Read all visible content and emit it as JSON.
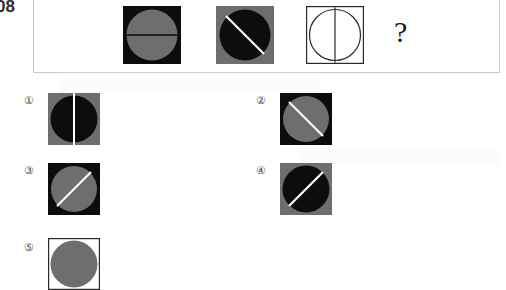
{
  "question": {
    "number_text": "08",
    "unknown_marker": "?"
  },
  "palette": {
    "black": "#0d0d0d",
    "gray": "#6e6e6e",
    "white": "#ffffff",
    "outline": "#2b2b2b",
    "frame_border": "#c9c9c9",
    "page_background": "#ffffff",
    "label_color": "#4a4a4a"
  },
  "stem": {
    "cells": [
      {
        "index": 1,
        "name": "stem-figure-1",
        "background": "#0d0d0d",
        "circle_fill": "#6e6e6e",
        "circle_outline": "none",
        "line_color": "#0d0d0d",
        "line_orientation": "horizontal",
        "description": "black square, gray circle, horizontal black line"
      },
      {
        "index": 2,
        "name": "stem-figure-2",
        "background": "#6e6e6e",
        "circle_fill": "#0d0d0d",
        "circle_outline": "none",
        "line_color": "#ffffff",
        "line_orientation": "diagonal-tl-br",
        "description": "gray square, black circle, white diagonal line from top-left to bottom-right"
      },
      {
        "index": 3,
        "name": "stem-figure-3",
        "background": "#ffffff",
        "circle_fill": "#ffffff",
        "circle_outline": "#2b2b2b",
        "line_color": "#2b2b2b",
        "line_orientation": "vertical",
        "description": "white square with outline, white circle outlined, vertical dark line"
      }
    ]
  },
  "options": [
    {
      "index": 1,
      "label": "①",
      "name": "option-1",
      "background": "#6e6e6e",
      "circle_fill": "#0d0d0d",
      "circle_outline": "none",
      "line_color": "#ffffff",
      "line_orientation": "vertical",
      "description": "gray square, black circle, white vertical line"
    },
    {
      "index": 2,
      "label": "②",
      "name": "option-2",
      "background": "#0d0d0d",
      "circle_fill": "#6e6e6e",
      "circle_outline": "none",
      "line_color": "#ffffff",
      "line_orientation": "diagonal-tl-br",
      "description": "black square, gray circle, white diagonal line from top-left to bottom-right"
    },
    {
      "index": 3,
      "label": "③",
      "name": "option-3",
      "background": "#0d0d0d",
      "circle_fill": "#6e6e6e",
      "circle_outline": "none",
      "line_color": "#ffffff",
      "line_orientation": "diagonal-bl-tr",
      "description": "black square, gray circle, white diagonal line from bottom-left to top-right"
    },
    {
      "index": 4,
      "label": "④",
      "name": "option-4",
      "background": "#6e6e6e",
      "circle_fill": "#0d0d0d",
      "circle_outline": "none",
      "line_color": "#ffffff",
      "line_orientation": "diagonal-bl-tr",
      "description": "gray square, black circle, white diagonal line from bottom-left to top-right"
    },
    {
      "index": 5,
      "label": "⑤",
      "name": "option-5",
      "background": "#ffffff",
      "circle_fill": "#6e6e6e",
      "circle_outline": "#2b2b2b",
      "line_color": "none",
      "line_orientation": "none",
      "description": "white square with outline, gray circle; figure clipped by bottom edge of page"
    }
  ]
}
